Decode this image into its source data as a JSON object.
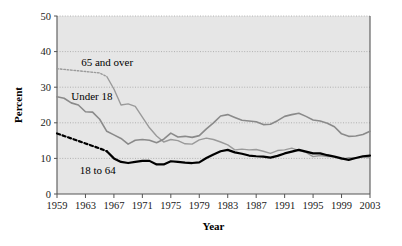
{
  "chart_data": {
    "type": "line",
    "title": "",
    "xlabel": "Year",
    "ylabel": "Percent",
    "xlim": [
      1959,
      2003
    ],
    "ylim": [
      0,
      50
    ],
    "yticks": [
      0,
      10,
      20,
      30,
      40,
      50
    ],
    "xticks": [
      1959,
      1963,
      1967,
      1971,
      1975,
      1979,
      1983,
      1987,
      1991,
      1995,
      1999,
      2003
    ],
    "grid": "horizontal-dotted",
    "legend": "inline-labels",
    "plot_background": "#e6e6e6",
    "x": [
      1959,
      1960,
      1961,
      1962,
      1963,
      1964,
      1965,
      1966,
      1967,
      1968,
      1969,
      1970,
      1971,
      1972,
      1973,
      1974,
      1975,
      1976,
      1977,
      1978,
      1979,
      1980,
      1981,
      1982,
      1983,
      1984,
      1985,
      1986,
      1987,
      1988,
      1989,
      1990,
      1991,
      1992,
      1993,
      1994,
      1995,
      1996,
      1997,
      1998,
      1999,
      2000,
      2001,
      2002,
      2003
    ],
    "series": [
      {
        "name": "65 and over",
        "label": "65 and over",
        "color": "#9a9a9a",
        "style": "dotted-then-solid",
        "dotted_until": 1966,
        "linewidth": 1.4,
        "values": [
          35.2,
          35.0,
          34.8,
          34.6,
          34.4,
          34.2,
          34.0,
          33.0,
          29.5,
          25.0,
          25.3,
          24.6,
          21.6,
          18.6,
          16.3,
          14.6,
          15.3,
          15.0,
          14.1,
          14.0,
          15.2,
          15.7,
          15.3,
          14.6,
          13.8,
          12.4,
          12.6,
          12.4,
          12.5,
          12.0,
          11.4,
          12.2,
          12.4,
          12.9,
          12.2,
          11.7,
          10.5,
          10.8,
          10.5,
          10.5,
          9.7,
          10.2,
          10.1,
          10.4,
          10.2
        ]
      },
      {
        "name": "Under 18",
        "label": "Under 18",
        "color": "#8a8a8a",
        "style": "solid",
        "linewidth": 1.6,
        "values": [
          27.3,
          26.9,
          25.6,
          25.0,
          23.1,
          23.0,
          21.0,
          17.6,
          16.6,
          15.6,
          14.0,
          15.1,
          15.3,
          15.1,
          14.4,
          15.4,
          17.1,
          16.0,
          16.2,
          15.9,
          16.4,
          18.3,
          20.0,
          21.9,
          22.3,
          21.5,
          20.7,
          20.5,
          20.3,
          19.5,
          19.6,
          20.6,
          21.8,
          22.3,
          22.7,
          21.8,
          20.8,
          20.5,
          19.9,
          18.9,
          16.9,
          16.2,
          16.3,
          16.7,
          17.6
        ]
      },
      {
        "name": "18 to 64",
        "label": "18 to 64",
        "color": "#000000",
        "style": "dashed-then-solid",
        "dashed_until": 1966,
        "linewidth": 2.2,
        "values": [
          17.0,
          16.3,
          15.6,
          14.9,
          14.2,
          13.5,
          12.8,
          12.0,
          10.0,
          9.0,
          8.7,
          9.0,
          9.3,
          9.3,
          8.3,
          8.3,
          9.2,
          9.0,
          8.8,
          8.7,
          8.9,
          10.1,
          11.1,
          12.0,
          12.4,
          11.7,
          11.3,
          10.8,
          10.6,
          10.5,
          10.2,
          10.7,
          11.4,
          11.9,
          12.4,
          11.9,
          11.4,
          11.4,
          10.9,
          10.5,
          10.0,
          9.6,
          10.1,
          10.6,
          10.8
        ]
      }
    ],
    "series_label_positions": [
      {
        "series": "65 and over",
        "x": 1962.4,
        "y": 36.0
      },
      {
        "series": "Under 18",
        "x": 1961.0,
        "y": 26.4
      },
      {
        "series": "18 to 64",
        "x": 1962.2,
        "y": 5.6
      }
    ]
  }
}
